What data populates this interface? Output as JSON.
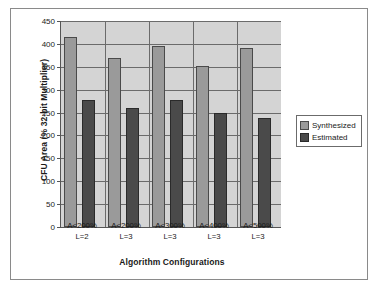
{
  "chart_data": {
    "type": "bar",
    "title": "",
    "xlabel": "Algorithm Configurations",
    "ylabel": "CFU Area (% 32-bit Multiplier)",
    "categories": [
      "A<200%\nL=2",
      "A<200%\nL=3",
      "A<300%\nL=3",
      "A<400%\nL=3",
      "A<500%\nL=3"
    ],
    "category_lines": [
      {
        "line1": "A<200%",
        "line2": "L=2"
      },
      {
        "line1": "A<200%",
        "line2": "L=3"
      },
      {
        "line1": "A<300%",
        "line2": "L=3"
      },
      {
        "line1": "A<400%",
        "line2": "L=3"
      },
      {
        "line1": "A<500%",
        "line2": "L=3"
      }
    ],
    "series": [
      {
        "name": "Synthesized",
        "color": "#9a9a9a",
        "values": [
          415,
          370,
          396,
          351,
          390
        ]
      },
      {
        "name": "Estimated",
        "color": "#4a4a4a",
        "values": [
          278,
          259,
          278,
          248,
          238
        ]
      }
    ],
    "ylim": [
      0,
      450
    ],
    "ytick_step": 50,
    "yticks": [
      450,
      400,
      350,
      300,
      250,
      200,
      150,
      100,
      50,
      0
    ],
    "ytick_labels": [
      "450",
      "400",
      "350",
      "300",
      "250",
      "200",
      "150",
      "100",
      "50",
      "0"
    ],
    "grid": true,
    "grid_axis": "y",
    "legend_position": "right",
    "plot_background": "#d4d4d4",
    "figure_background": "#ffffff",
    "axis_color": "#555555",
    "grid_color": "#6b6b6b",
    "frame_border_color": "#8a8a8a"
  },
  "legend": {
    "entries": [
      {
        "label": "Synthesized"
      },
      {
        "label": "Estimated"
      }
    ]
  }
}
